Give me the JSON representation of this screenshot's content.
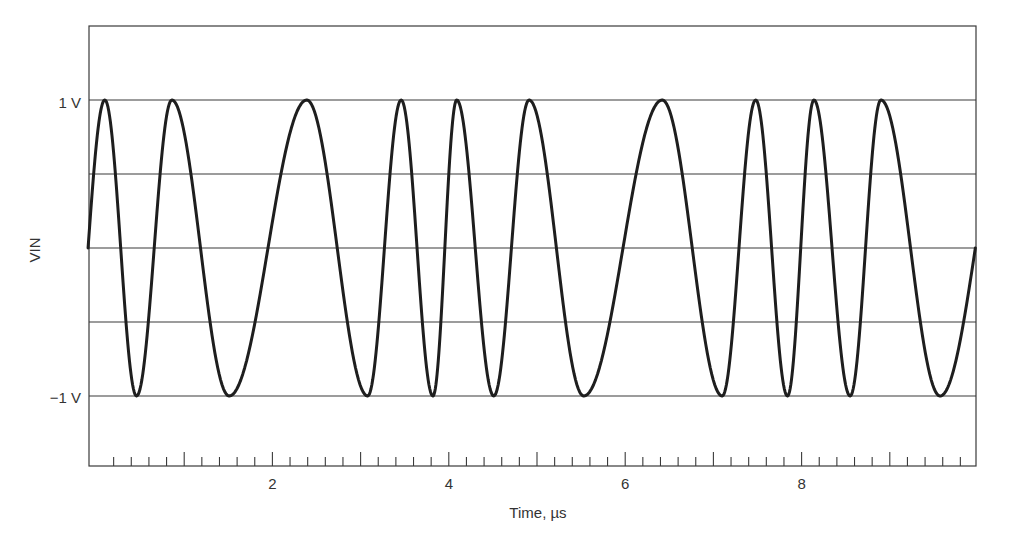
{
  "chart_data": {
    "type": "line",
    "title": "",
    "xlabel": "Time, µs",
    "ylabel": "VIN",
    "xlim": [
      -0.09,
      9.98
    ],
    "ylim": [
      -1.5,
      1.5
    ],
    "x_ticks": {
      "major": [
        1,
        2,
        3,
        4,
        5,
        6,
        7,
        8,
        9
      ],
      "minor_step": 0.2,
      "labels": [
        {
          "value": 2,
          "text": "2"
        },
        {
          "value": 4,
          "text": "4"
        },
        {
          "value": 6,
          "text": "6"
        },
        {
          "value": 8,
          "text": "8"
        }
      ]
    },
    "y_ticks": {
      "labels": [
        {
          "value": 1,
          "text": "1 V"
        },
        {
          "value": -1,
          "text": "−1 V"
        }
      ]
    },
    "grid": {
      "horizontal": [
        1,
        0.5,
        0,
        -0.5,
        -1
      ],
      "vertical": false
    },
    "legend": null,
    "series": [
      {
        "name": "VIN",
        "description": "FSK-like sinusoid alternating between low and high frequency, amplitude 1 V",
        "extrema": [
          {
            "t": -0.09,
            "v": 0
          },
          {
            "t": 0.1,
            "v": 1
          },
          {
            "t": 0.46,
            "v": -1
          },
          {
            "t": 0.86,
            "v": 1
          },
          {
            "t": 1.51,
            "v": -1
          },
          {
            "t": 2.39,
            "v": 1
          },
          {
            "t": 3.08,
            "v": -1
          },
          {
            "t": 3.46,
            "v": 1
          },
          {
            "t": 3.82,
            "v": -1
          },
          {
            "t": 4.09,
            "v": 1
          },
          {
            "t": 4.51,
            "v": -1
          },
          {
            "t": 4.91,
            "v": 1
          },
          {
            "t": 5.53,
            "v": -1
          },
          {
            "t": 6.42,
            "v": 1
          },
          {
            "t": 7.1,
            "v": -1
          },
          {
            "t": 7.48,
            "v": 1
          },
          {
            "t": 7.84,
            "v": -1
          },
          {
            "t": 8.14,
            "v": 1
          },
          {
            "t": 8.55,
            "v": -1
          },
          {
            "t": 8.9,
            "v": 1
          },
          {
            "t": 9.57,
            "v": -1
          },
          {
            "t": 9.97,
            "v": 0
          }
        ]
      }
    ]
  },
  "colors": {
    "line": "#1e1e1e",
    "grid": "#3a3a3a",
    "text": "#333333",
    "background": "#ffffff"
  }
}
